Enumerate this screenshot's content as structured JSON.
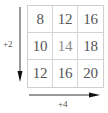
{
  "diagram": {
    "type": "number-grid",
    "rows": 3,
    "columns": 3,
    "cells": [
      [
        "8",
        "12",
        "16"
      ],
      [
        "10",
        "14",
        "18"
      ],
      [
        "12",
        "16",
        "20"
      ]
    ],
    "vertical_arrow": {
      "direction": "down",
      "label": "+2"
    },
    "horizontal_arrow": {
      "direction": "right",
      "label": "+4"
    }
  },
  "colors": {
    "grid_line": "#d4d4d4",
    "text": "#555555",
    "center_text": "#8a8a8a",
    "arrow": "#222222"
  }
}
